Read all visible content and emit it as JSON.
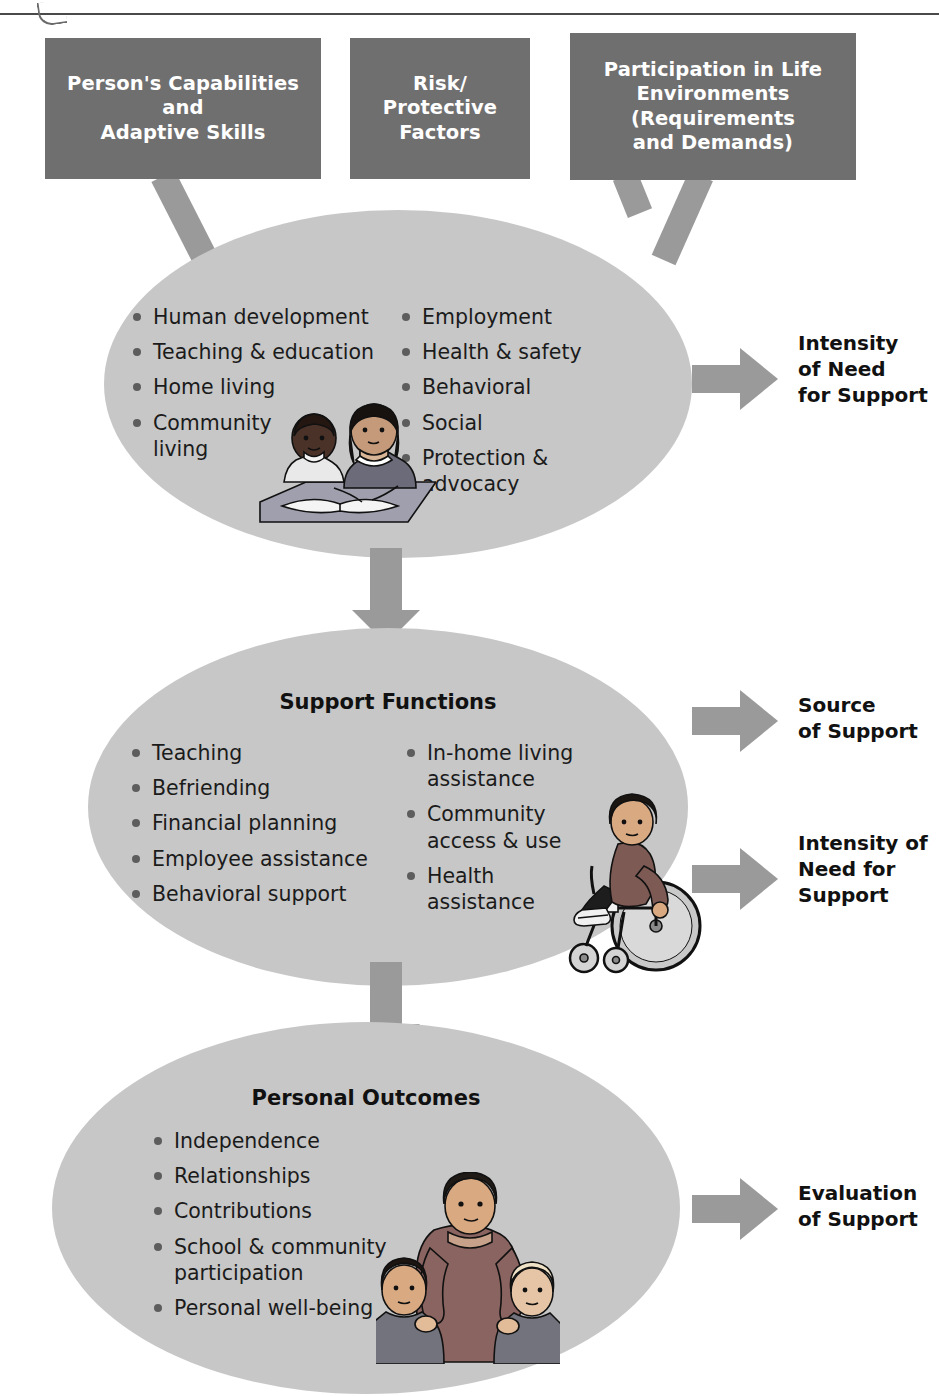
{
  "diagram": {
    "colors": {
      "header_box": "#6f6f6f",
      "ellipse": "#c7c7c7",
      "arrow": "#9a9a9a",
      "text_dark": "#1b1b1b",
      "text_light": "#ffffff",
      "bullet": "#5d5d5d"
    }
  },
  "header_boxes": [
    {
      "id": "capabilities",
      "label": "Person's Capabilities\nand\nAdaptive Skills"
    },
    {
      "id": "risk",
      "label": "Risk/\nProtective\nFactors"
    },
    {
      "id": "participation",
      "label": "Participation in Life\nEnvironments\n(Requirements\nand Demands)"
    }
  ],
  "ellipses": [
    {
      "id": "needs",
      "title": "",
      "left_column": [
        "Human development",
        "Teaching & education",
        "Home living",
        "Community\nliving"
      ],
      "right_column": [
        "Employment",
        "Health & safety",
        "Behavioral",
        "Social",
        "Protection &\nadvocacy"
      ],
      "illustration": "students-reading-illustration"
    },
    {
      "id": "functions",
      "title": "Support Functions",
      "left_column": [
        "Teaching",
        "Befriending",
        "Financial planning",
        "Employee assistance",
        "Behavioral support"
      ],
      "right_column": [
        "In-home living\nassistance",
        "Community\naccess & use",
        "Health\nassistance"
      ],
      "illustration": "person-in-wheelchair-illustration"
    },
    {
      "id": "outcomes",
      "title": "Personal Outcomes",
      "left_column": [
        "Independence",
        "Relationships",
        "Contributions",
        "School & community\nparticipation",
        "Personal well-being"
      ],
      "right_column": [],
      "illustration": "family-group-illustration"
    }
  ],
  "output_labels": [
    {
      "id": "intensity-1",
      "label": "Intensity\nof Need\nfor Support"
    },
    {
      "id": "source",
      "label": "Source\nof Support"
    },
    {
      "id": "intensity-2",
      "label": "Intensity of\nNeed for\nSupport"
    },
    {
      "id": "evaluation",
      "label": "Evaluation\nof Support"
    }
  ]
}
